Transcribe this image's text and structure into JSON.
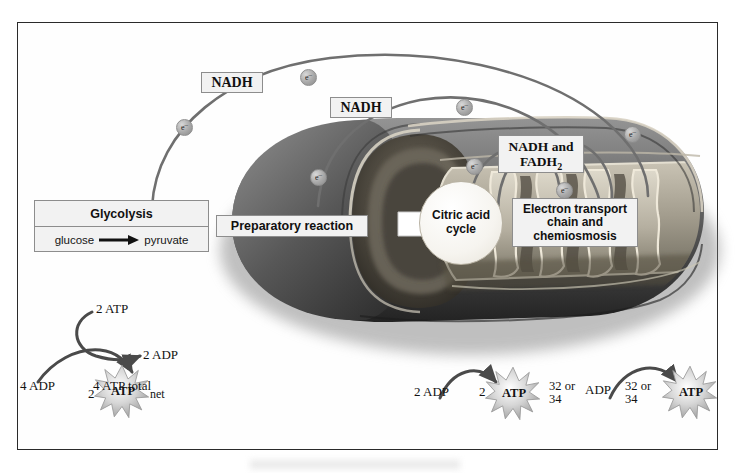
{
  "figure": {
    "organelle": "mitochondrion",
    "border_color": "#2a2a2a",
    "label_bg": "#f2f2f2",
    "label_border": "#8d8d8d",
    "curve_color": "#6f6f6f"
  },
  "stage_labels": {
    "glycolysis_title": "Glycolysis",
    "glycolysis_reactant": "glucose",
    "glycolysis_product": "pyruvate",
    "prep_reaction": "Preparatory reaction",
    "citric_acid_line1": "Citric acid",
    "citric_acid_line2": "cycle",
    "etc_line1": "Electron transport",
    "etc_line2": "chain and",
    "etc_line3": "chemiosmosis"
  },
  "carriers": {
    "nadh_glycolysis": "NADH",
    "nadh_prep": "NADH",
    "nadh_fadh2_line1": "NADH and",
    "nadh_fadh2_line2_prefix": "FADH",
    "nadh_fadh2_line2_sub": "2"
  },
  "electrons": {
    "symbol": "e",
    "charge": "–",
    "count": 7
  },
  "glycolysis_yield": {
    "atp_used": "2 ATP",
    "adp_formed": "2 ADP",
    "adp_input": "4 ADP",
    "atp_total": "4 ATP total",
    "net_count": "2",
    "net_label": "ATP",
    "net_suffix": "net"
  },
  "citric_yield": {
    "adp_input": "2 ADP",
    "atp_count": "2",
    "atp_label": "ATP"
  },
  "etc_yield": {
    "adp_count_line1": "32 or",
    "adp_count_line2": "34",
    "adp_label": "ADP",
    "atp_count_line1": "32 or",
    "atp_count_line2": "34",
    "atp_label": "ATP"
  }
}
